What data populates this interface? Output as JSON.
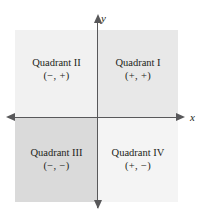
{
  "figure": {
    "type": "coordinate-plane-quadrants",
    "background_color": "#ffffff",
    "axis_color": "#58585a",
    "text_color": "#231f20"
  },
  "axes": {
    "y_label": "y",
    "x_label": "x",
    "origin": {
      "x": 98,
      "y": 118
    }
  },
  "quadrants": [
    {
      "id": "quadrant-1",
      "name": "Quadrant I",
      "signs": "(+, +)",
      "fill": "#e8e8e8",
      "position": "top-right"
    },
    {
      "id": "quadrant-2",
      "name": "Quadrant II",
      "signs": "(−, +)",
      "fill": "#f1f1f1",
      "position": "top-left"
    },
    {
      "id": "quadrant-3",
      "name": "Quadrant III",
      "signs": "(−, −)",
      "fill": "#dadada",
      "position": "bottom-left"
    },
    {
      "id": "quadrant-4",
      "name": "Quadrant IV",
      "signs": "(+, −)",
      "fill": "#f4f4f4",
      "position": "bottom-right"
    }
  ]
}
